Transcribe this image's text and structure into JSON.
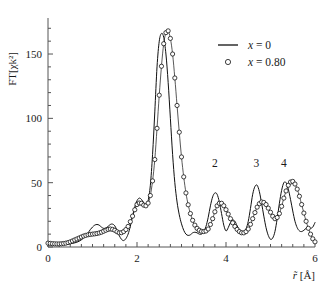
{
  "chart_data": {
    "type": "line",
    "title": "",
    "xlabel": "r̃ [Å]",
    "ylabel": "FT[χk²]",
    "xlim": [
      0,
      6
    ],
    "ylim": [
      0,
      178
    ],
    "grid": false,
    "legend_position": "top-right",
    "x_ticks": [
      0,
      2,
      4,
      6
    ],
    "x_tick_labels": [
      "0",
      "2",
      "4",
      "6"
    ],
    "x_minor_tick_step": 0.25,
    "y_ticks": [
      0,
      50,
      100,
      150
    ],
    "y_tick_labels": [
      "0",
      "50",
      "100",
      "150"
    ],
    "y_minor_tick_step": 10,
    "annotations": [
      {
        "label": "2",
        "x": 3.75,
        "y": 62
      },
      {
        "label": "3",
        "x": 4.68,
        "y": 62
      },
      {
        "label": "4",
        "x": 5.3,
        "y": 62
      }
    ],
    "series": [
      {
        "name": "x = 0",
        "style": "line",
        "color": "#101010",
        "x": [
          0.0,
          0.1,
          0.2,
          0.3,
          0.4,
          0.5,
          0.6,
          0.7,
          0.8,
          0.9,
          0.95,
          1.0,
          1.05,
          1.1,
          1.15,
          1.2,
          1.25,
          1.3,
          1.35,
          1.4,
          1.45,
          1.5,
          1.55,
          1.6,
          1.65,
          1.7,
          1.75,
          1.8,
          1.85,
          1.9,
          1.95,
          2.0,
          2.05,
          2.1,
          2.15,
          2.2,
          2.25,
          2.3,
          2.35,
          2.4,
          2.45,
          2.5,
          2.55,
          2.6,
          2.65,
          2.7,
          2.75,
          2.8,
          2.85,
          2.9,
          2.95,
          3.0,
          3.05,
          3.1,
          3.15,
          3.2,
          3.25,
          3.3,
          3.35,
          3.4,
          3.45,
          3.5,
          3.55,
          3.6,
          3.65,
          3.7,
          3.75,
          3.8,
          3.85,
          3.9,
          3.95,
          4.0,
          4.05,
          4.1,
          4.15,
          4.2,
          4.25,
          4.3,
          4.35,
          4.4,
          4.45,
          4.5,
          4.55,
          4.6,
          4.65,
          4.7,
          4.75,
          4.8,
          4.85,
          4.9,
          4.95,
          5.0,
          5.05,
          5.1,
          5.15,
          5.2,
          5.25,
          5.3,
          5.35,
          5.4,
          5.45,
          5.5,
          5.55,
          5.6,
          5.65,
          5.7,
          5.75,
          5.8,
          5.85,
          5.9,
          5.95,
          6.0
        ],
        "y": [
          3.0,
          2.5,
          2.2,
          2.0,
          2.2,
          2.6,
          3.2,
          4.5,
          7.0,
          11.0,
          13.5,
          15.5,
          17.0,
          17.5,
          17.0,
          15.5,
          14.5,
          14.8,
          16.0,
          17.5,
          17.8,
          16.5,
          13.0,
          9.0,
          6.0,
          5.0,
          6.5,
          10.0,
          16.0,
          24.0,
          31.0,
          36.0,
          38.0,
          37.0,
          34.5,
          33.0,
          36.0,
          48.0,
          72.0,
          105.0,
          140.0,
          160.0,
          166.0,
          163.0,
          150.0,
          128.0,
          100.0,
          72.0,
          50.0,
          35.0,
          25.0,
          18.0,
          13.0,
          10.0,
          9.0,
          9.5,
          11.0,
          11.5,
          11.0,
          10.0,
          10.0,
          12.0,
          16.0,
          23.0,
          32.0,
          39.0,
          42.0,
          41.0,
          35.0,
          26.0,
          17.0,
          12.5,
          15.0,
          19.0,
          21.0,
          20.0,
          16.5,
          13.0,
          11.0,
          11.0,
          14.0,
          20.0,
          30.0,
          41.0,
          47.0,
          48.0,
          43.0,
          34.0,
          24.0,
          15.0,
          9.0,
          6.0,
          7.0,
          12.0,
          22.0,
          34.0,
          44.0,
          50.0,
          50.0,
          45.0,
          37.0,
          28.0,
          20.0,
          15.0,
          12.5,
          12.0,
          13.0,
          14.5,
          15.0,
          14.5,
          15.5,
          19.0
        ]
      },
      {
        "name": "x = 0.80",
        "style": "markers-open-circle",
        "color": "#101010",
        "x": [
          0.0,
          0.1,
          0.2,
          0.3,
          0.4,
          0.5,
          0.6,
          0.7,
          0.8,
          0.9,
          1.0,
          1.1,
          1.2,
          1.3,
          1.4,
          1.5,
          1.6,
          1.7,
          1.8,
          1.9,
          2.0,
          2.1,
          2.2,
          2.3,
          2.4,
          2.5,
          2.6,
          2.7,
          2.8,
          2.9,
          3.0,
          3.1,
          3.2,
          3.3,
          3.4,
          3.5,
          3.6,
          3.7,
          3.8,
          3.9,
          4.0,
          4.1,
          4.2,
          4.3,
          4.4,
          4.5,
          4.6,
          4.7,
          4.8,
          4.9,
          5.0,
          5.1,
          5.2,
          5.3,
          5.4,
          5.5,
          5.6,
          5.7,
          5.8,
          5.9,
          6.0
        ],
        "y": [
          3.0,
          2.6,
          2.4,
          2.5,
          3.0,
          4.0,
          5.5,
          7.0,
          8.5,
          9.5,
          10.0,
          10.5,
          11.5,
          13.0,
          14.0,
          13.0,
          11.0,
          12.0,
          16.0,
          24.0,
          33.0,
          34.0,
          32.0,
          40.0,
          68.0,
          118.0,
          158.0,
          168.0,
          150.0,
          110.0,
          70.0,
          42.0,
          26.0,
          17.0,
          13.0,
          12.0,
          14.0,
          22.0,
          32.0,
          34.0,
          29.0,
          22.0,
          16.0,
          12.0,
          11.0,
          14.0,
          22.0,
          31.0,
          35.0,
          33.0,
          27.0,
          22.0,
          26.0,
          38.0,
          48.0,
          51.0,
          45.0,
          33.0,
          20.0,
          10.0,
          4.0
        ]
      }
    ]
  },
  "legend": {
    "entries": [
      {
        "marker": "line",
        "label_var": "x",
        "label_eq": " = 0"
      },
      {
        "marker": "circle",
        "label_var": "x",
        "label_eq": " = 0.80"
      }
    ]
  },
  "axes": {
    "y_title": "FT[χk²]",
    "x_title_symbol": "r̃",
    "x_title_unit": "[Å]"
  }
}
